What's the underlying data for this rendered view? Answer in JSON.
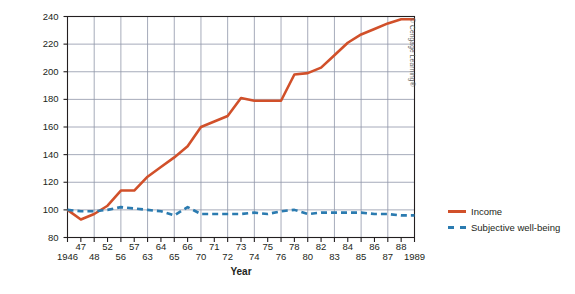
{
  "chart_data": {
    "type": "line",
    "title": "",
    "xlabel": "Year",
    "ylabel": "Percentage of after-tax disposable personal income (adjusted for inflation)",
    "ylim": [
      80,
      240
    ],
    "yticks": [
      80,
      100,
      120,
      140,
      160,
      180,
      200,
      220,
      240
    ],
    "grid": true,
    "legend_position": "right",
    "x_tick_rows": {
      "upper": [
        "47",
        "52",
        "57",
        "64",
        "66",
        "71",
        "73",
        "75",
        "78",
        "82",
        "84",
        "86",
        "88"
      ],
      "lower": [
        "1946",
        "48",
        "56",
        "63",
        "65",
        "70",
        "72",
        "74",
        "76",
        "80",
        "83",
        "85",
        "87",
        "1989"
      ]
    },
    "x": [
      "1946",
      "47",
      "48",
      "52",
      "56",
      "57",
      "63",
      "64",
      "65",
      "66",
      "70",
      "71",
      "72",
      "73",
      "74",
      "75",
      "76",
      "78",
      "80",
      "82",
      "83",
      "84",
      "85",
      "86",
      "87",
      "88",
      "1989"
    ],
    "series": [
      {
        "name": "Income",
        "color": "#d1502a",
        "style": "solid",
        "values": [
          100,
          93,
          97,
          103,
          114,
          114,
          124,
          131,
          138,
          146,
          160,
          164,
          168,
          181,
          179,
          179,
          179,
          198,
          199,
          203,
          212,
          221,
          227,
          231,
          235,
          238,
          238
        ]
      },
      {
        "name": "Subjective well-being",
        "color": "#2b7bb0",
        "style": "dashed",
        "values": [
          100,
          99,
          99,
          100,
          102,
          101,
          100,
          99,
          96,
          102,
          97,
          97,
          97,
          97,
          98,
          97,
          99,
          100,
          97,
          98,
          98,
          98,
          98,
          97,
          97,
          96,
          96
        ]
      }
    ]
  },
  "legend": {
    "items": [
      {
        "label": "Income",
        "style": "solid",
        "color": "#d1502a"
      },
      {
        "label": "Subjective well-being",
        "style": "dashed",
        "color": "#2b7bb0"
      }
    ]
  },
  "credit": {
    "text": "© Cengage Learning®"
  },
  "colors": {
    "income": "#d1502a",
    "wellbeing": "#2b7bb0",
    "axis": "#231f20",
    "grid": "#8f96a8",
    "background": "#ffffff"
  }
}
